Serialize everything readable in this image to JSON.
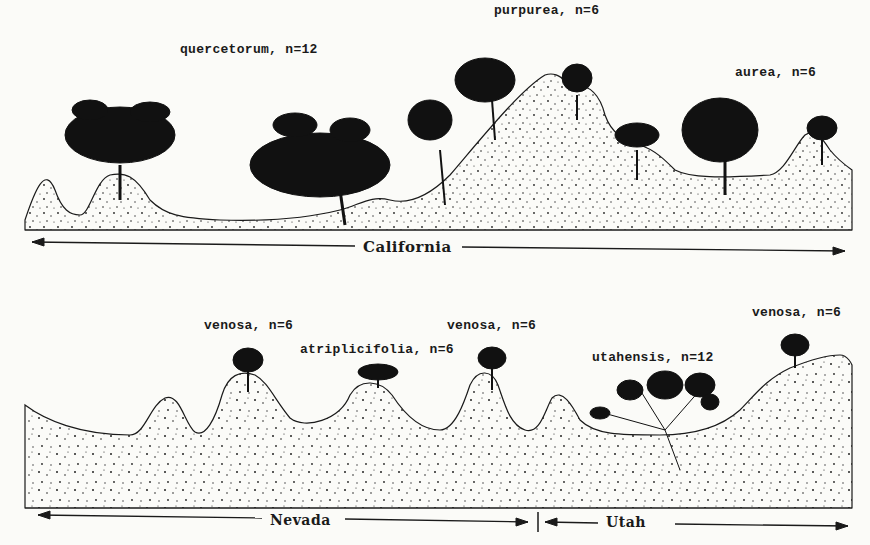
{
  "top_panel": {
    "labels": [
      {
        "text": "quercetorum, n=12",
        "x": 180,
        "y": 42
      },
      {
        "text": "purpurea, n=6",
        "x": 494,
        "y": 3
      },
      {
        "text": "aurea, n=6",
        "x": 735,
        "y": 65
      }
    ],
    "region": {
      "text": "California"
    }
  },
  "bottom_panel": {
    "labels": [
      {
        "text": "venosa, n=6",
        "x": 204,
        "y": 318
      },
      {
        "text": "atriplicifolia, n=6",
        "x": 300,
        "y": 342
      },
      {
        "text": "venosa, n=6",
        "x": 447,
        "y": 318
      },
      {
        "text": "utahensis, n=12",
        "x": 592,
        "y": 350
      },
      {
        "text": "venosa, n=6",
        "x": 752,
        "y": 305
      }
    ],
    "regions": [
      {
        "text": "Nevada"
      },
      {
        "text": "Utah"
      }
    ]
  },
  "colors": {
    "ink": "#1a1a1a",
    "paper": "#fbfbf8"
  }
}
